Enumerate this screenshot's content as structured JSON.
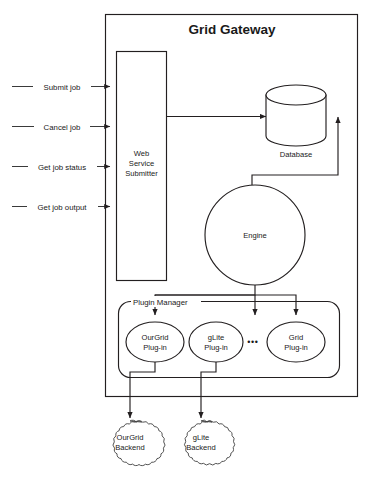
{
  "figure": {
    "title": "Grid Gateway",
    "background_color": "#ffffff",
    "line_color": "#231f20"
  },
  "inputs": [
    {
      "label": "Submit job"
    },
    {
      "label": "Cancel job"
    },
    {
      "label": "Get job status"
    },
    {
      "label": "Get job output"
    }
  ],
  "components": {
    "web_service": {
      "line1": "Web",
      "line2": "Service",
      "line3": "Submitter"
    },
    "database": {
      "label": "Database"
    },
    "engine": {
      "label": "Engine"
    },
    "plugin_manager": {
      "label": "Plugin Manager",
      "ellipsis": "•••",
      "plugins": [
        {
          "line1": "OurGrid",
          "line2": "Plug-in"
        },
        {
          "line1": "gLite",
          "line2": "Plug-in"
        },
        {
          "line1": "Grid",
          "line2": "Plug-in"
        }
      ]
    },
    "backends": [
      {
        "line1": "OurGrid",
        "line2": "Backend"
      },
      {
        "line1": "gLite",
        "line2": "Backend"
      }
    ]
  }
}
